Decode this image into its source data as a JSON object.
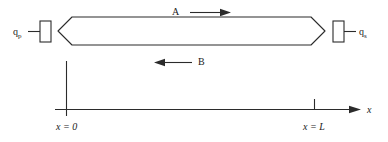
{
  "figure": {
    "type": "schematic-diagram",
    "background_color": "#ffffff",
    "line_color": "#2b2b2b"
  },
  "body": {
    "name": "slab",
    "left_boundary_label": "x = 0",
    "right_boundary_label": "x = L"
  },
  "flux_labels": {
    "left": {
      "symbol": "q",
      "subscript": "p",
      "text": "q"
    },
    "right": {
      "symbol": "q",
      "subscript": "s",
      "text": "q"
    }
  },
  "flow_arrows": [
    {
      "label": "A",
      "direction": "right"
    },
    {
      "label": "B",
      "direction": "left"
    }
  ],
  "axis": {
    "name": "x",
    "ticks": [
      {
        "label": "x = 0",
        "value": "0"
      },
      {
        "label": "x = L",
        "value": "L"
      }
    ]
  }
}
